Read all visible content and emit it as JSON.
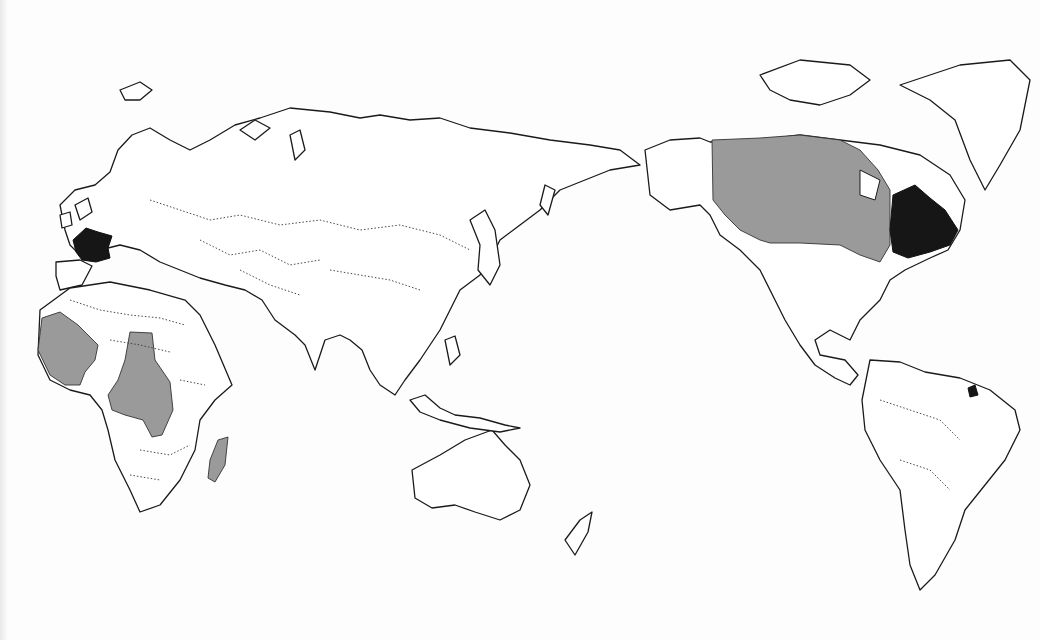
{
  "map": {
    "projection": "Pacific-centered world outline map",
    "legend_colors": {
      "dark": "#161616",
      "grey": "#9a9a9a",
      "land": "#ffffff",
      "outline": "#1a1a1a"
    },
    "dark_regions": [
      "France",
      "Quebec",
      "French Guiana"
    ],
    "grey_regions": [
      "Canada (rest)",
      "West Africa",
      "Central Africa",
      "Madagascar"
    ]
  }
}
